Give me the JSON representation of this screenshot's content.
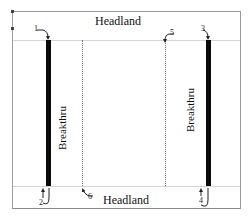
{
  "diagram": {
    "type": "field-pass-layout",
    "headland_top": "Headland",
    "headland_bottom": "Headland",
    "breakthru_left": "Breakthru",
    "breakthru_right": "Breakthru",
    "markers": [
      {
        "id": "1",
        "label": "1",
        "position": "top-left",
        "direction": "down"
      },
      {
        "id": "2",
        "label": "2",
        "position": "bottom-left",
        "direction": "up"
      },
      {
        "id": "3",
        "label": "3",
        "position": "top-right",
        "direction": "down"
      },
      {
        "id": "4",
        "label": "4",
        "position": "bottom-right",
        "direction": "up"
      },
      {
        "id": "5",
        "label": "5",
        "position": "top-middle-right",
        "direction": "down"
      },
      {
        "id": "6",
        "label": "6",
        "position": "bottom-middle-left",
        "direction": "up"
      }
    ],
    "colors": {
      "breakthru_line": "#0a0a0a",
      "pass_line": "#777777",
      "headland_line": "#d6d6d6",
      "frame": "#9a9a9a"
    }
  }
}
